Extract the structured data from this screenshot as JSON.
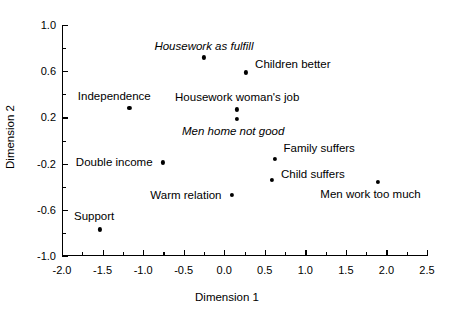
{
  "chart_data": {
    "type": "scatter",
    "title": "",
    "xlabel": "Dimension 1",
    "ylabel": "Dimension 2",
    "xlim": [
      -2.0,
      2.5
    ],
    "ylim": [
      -1.0,
      1.0
    ],
    "xticks": [
      -2.0,
      -1.5,
      -1.0,
      -0.5,
      0.0,
      0.5,
      1.0,
      1.5,
      2.0,
      2.5
    ],
    "xticklabels": [
      "-2.0",
      "-1.5",
      "-1.0",
      "-0.5",
      "0.0",
      "0.5",
      "1.0",
      "1.5",
      "2.0",
      "2.5"
    ],
    "xminorticks": [
      -1.75,
      -1.25,
      -0.75,
      -0.25,
      0.25,
      0.75,
      1.25,
      1.75,
      2.25
    ],
    "yticks": [
      1.0,
      0.6,
      0.2,
      -0.2,
      -0.6,
      -1.0
    ],
    "yticklabels": [
      "1.0",
      "0.6",
      "0.2",
      "-0.2",
      "-0.6",
      "-1.0"
    ],
    "yminorticks": [
      0.8,
      0.4,
      0.0,
      -0.4,
      -0.8
    ],
    "grid": false,
    "legend": null,
    "marker_color": "#000000",
    "points": [
      {
        "label": "Housework as fulfill",
        "x": -0.25,
        "y": 0.72,
        "italic": true,
        "label_anchor": "center",
        "label_dx": 0,
        "label_dy": -11
      },
      {
        "label": "Children better",
        "x": 0.27,
        "y": 0.59,
        "italic": false,
        "label_anchor": "left",
        "label_dx": 9,
        "label_dy": -8
      },
      {
        "label": "Independence",
        "x": -1.17,
        "y": 0.28,
        "italic": false,
        "label_anchor": "center",
        "label_dx": -15,
        "label_dy": -12
      },
      {
        "label": "Housework woman's job",
        "x": 0.16,
        "y": 0.27,
        "italic": false,
        "label_anchor": "center",
        "label_dx": 0,
        "label_dy": -12
      },
      {
        "label": "Men home not good",
        "x": 0.16,
        "y": 0.19,
        "italic": true,
        "label_anchor": "center",
        "label_dx": -4,
        "label_dy": 12
      },
      {
        "label": "Family suffers",
        "x": 0.62,
        "y": -0.16,
        "italic": false,
        "label_anchor": "left",
        "label_dx": 9,
        "label_dy": -11
      },
      {
        "label": "Double income",
        "x": -0.76,
        "y": -0.19,
        "italic": false,
        "label_anchor": "right",
        "label_dx": -10,
        "label_dy": 0
      },
      {
        "label": "Child suffers",
        "x": 0.59,
        "y": -0.34,
        "italic": false,
        "label_anchor": "left",
        "label_dx": 9,
        "label_dy": -6
      },
      {
        "label": "Men work too much",
        "x": 1.89,
        "y": -0.36,
        "italic": false,
        "label_anchor": "center",
        "label_dx": -7,
        "label_dy": 12
      },
      {
        "label": "Warm relation",
        "x": 0.09,
        "y": -0.47,
        "italic": false,
        "label_anchor": "right",
        "label_dx": -10,
        "label_dy": 0
      },
      {
        "label": "Support",
        "x": -1.53,
        "y": -0.77,
        "italic": false,
        "label_anchor": "center",
        "label_dx": -6,
        "label_dy": -13
      }
    ]
  }
}
